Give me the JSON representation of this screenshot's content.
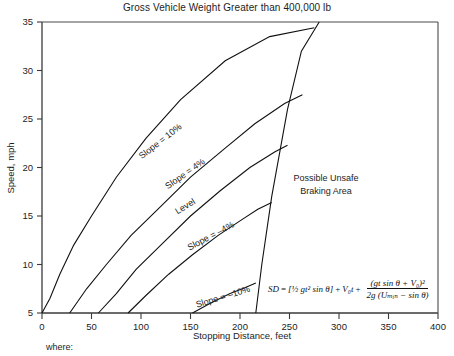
{
  "chart_data": {
    "type": "line",
    "title": "Gross Vehicle Weight Greater than 400,000 lb",
    "xlabel": "Stopping Distance, feet",
    "ylabel": "Speed, mph",
    "xlim": [
      0,
      400
    ],
    "ylim": [
      5,
      35
    ],
    "xticks": [
      "0",
      "50",
      "100",
      "150",
      "200",
      "250",
      "300",
      "350",
      "400"
    ],
    "yticks": [
      "5",
      "10",
      "15",
      "20",
      "25",
      "30",
      "35"
    ],
    "grid": false,
    "legend": "none",
    "series": [
      {
        "name": "Slope = 10%",
        "label": "Slope = 10%",
        "points": [
          [
            0,
            5
          ],
          [
            8,
            6.5
          ],
          [
            18,
            9
          ],
          [
            32,
            12
          ],
          [
            50,
            15
          ],
          [
            75,
            19
          ],
          [
            105,
            23
          ],
          [
            140,
            27
          ],
          [
            185,
            31
          ],
          [
            230,
            33.5
          ],
          [
            275,
            34.4
          ]
        ]
      },
      {
        "name": "Slope = 4%",
        "label": "Slope = 4%",
        "points": [
          [
            28,
            5
          ],
          [
            45,
            7.5
          ],
          [
            65,
            10
          ],
          [
            90,
            13
          ],
          [
            120,
            16
          ],
          [
            150,
            19
          ],
          [
            185,
            22
          ],
          [
            215,
            24.5
          ],
          [
            245,
            26.6
          ],
          [
            263,
            27.5
          ]
        ]
      },
      {
        "name": "Level",
        "label": "Level",
        "points": [
          [
            57,
            5
          ],
          [
            75,
            7
          ],
          [
            95,
            9.5
          ],
          [
            120,
            12
          ],
          [
            150,
            15
          ],
          [
            180,
            17.6
          ],
          [
            210,
            20
          ],
          [
            235,
            21.6
          ],
          [
            248,
            22.3
          ]
        ]
      },
      {
        "name": "Slope = -4%",
        "label": "Slope = –4%",
        "points": [
          [
            87,
            5
          ],
          [
            105,
            6.8
          ],
          [
            128,
            9
          ],
          [
            152,
            11
          ],
          [
            178,
            13
          ],
          [
            200,
            14.5
          ],
          [
            218,
            15.7
          ],
          [
            232,
            16.4
          ]
        ]
      },
      {
        "name": "Slope = -10%",
        "label": "Slope = –10%",
        "points": [
          [
            152,
            5
          ],
          [
            170,
            6
          ],
          [
            190,
            7
          ],
          [
            205,
            7.6
          ],
          [
            216,
            8.1
          ]
        ]
      },
      {
        "name": "Unsafe boundary",
        "label": "",
        "points": [
          [
            216,
            5
          ],
          [
            222,
            10
          ],
          [
            232,
            17
          ],
          [
            248,
            26
          ],
          [
            262,
            32
          ],
          [
            280,
            35
          ]
        ]
      }
    ],
    "annotations": [
      {
        "name": "unsafe-area",
        "line1": "Possible Unsafe",
        "line2": "Braking Area"
      }
    ],
    "formula": {
      "lhs": "SD",
      "equals": "=",
      "term1": "[½ gt² sin θ]",
      "plus1": "+",
      "term2": "V₀t",
      "plus2": "+",
      "fraction_numerator": "(gt sin θ + V₀)²",
      "fraction_denominator": "2g (Uₘᵢₙ − sin θ)"
    },
    "footnote": "where:",
    "colors": {
      "curve": "#111111",
      "axis": "#3a3a3a",
      "background": "#ffffff",
      "text": "#1d1d1d"
    }
  }
}
